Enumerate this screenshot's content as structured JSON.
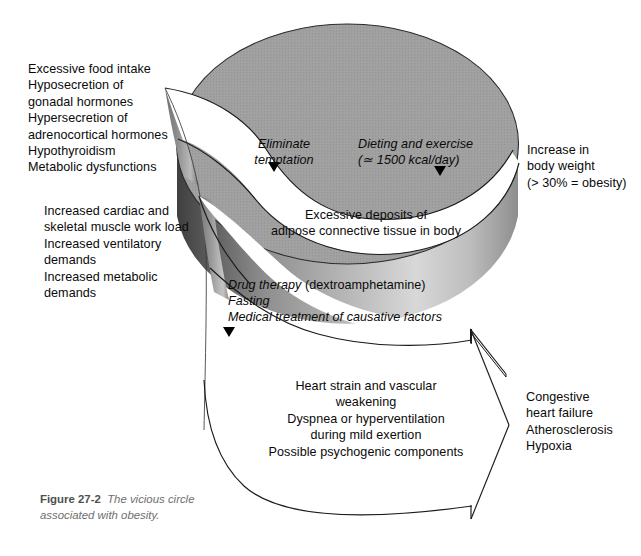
{
  "figure": {
    "caption_label": "Figure 27-2",
    "caption_text": "The vicious circle",
    "caption_text_line2": "associated with obesity."
  },
  "labels": {
    "causes": "Excessive food intake\nHyposecretion of\ngonadal hormones\nHypersecretion of\nadrenocortical hormones\nHypothyroidism\nMetabolic dysfunctions",
    "secondary_effects": "Increased cardiac and\nskeletal muscle work load\nIncreased ventilatory\ndemands\nIncreased metabolic\ndemands",
    "intervention_1": "Eliminate\ntemptation",
    "intervention_2": "Dieting and exercise\n(≃ 1500 kcal/day)",
    "outcome_weight": "Increase in\nbody weight\n(> 30% = obesity)",
    "deposits": "Excessive deposits of\nadipose connective tissue in body",
    "therapy_line1_italic": "Drug therapy",
    "therapy_line1_roman": " (dextroamphetamine)",
    "therapy_line2": "Fasting",
    "therapy_line3": "Medical treatment of causative factors",
    "cardiac_effects": "Heart strain and vascular\nweakening\nDyspnea or hyperventilation\nduring mild exertion\nPossible psychogenic components",
    "final_outcome": "Congestive\nheart failure\nAtherosclerosis\nHypoxia"
  },
  "colors": {
    "cylinder_top": "#9b9b9b",
    "cylinder_top_dark": "#8a8a8a",
    "cylinder_side_dark": "#4a4a4a",
    "cylinder_side_light": "#cfcfcf",
    "outline": "#1a1a1a",
    "background": "#ffffff",
    "caption_gray": "#6e6e6e"
  },
  "markers": {
    "arrow_marker_1": "down-triangle",
    "arrow_marker_2": "down-triangle",
    "arrow_marker_3": "down-triangle",
    "big_arrow": "right-arrow"
  }
}
